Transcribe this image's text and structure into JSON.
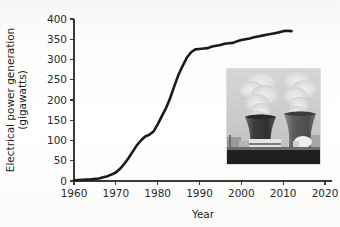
{
  "chart_data": {
    "type": "line",
    "title": "",
    "xlabel": "Year",
    "ylabel": "Electrical power generation (gigawatts)",
    "ylabel_line1": "Electrical power generation",
    "ylabel_line2": "(gigawatts)",
    "xlim": [
      1960,
      2020
    ],
    "ylim": [
      0,
      400
    ],
    "xticks": [
      1960,
      1970,
      1980,
      1990,
      2000,
      2010,
      2020
    ],
    "xtick_labels": [
      "1960",
      "1970",
      "1980",
      "1990",
      "2000",
      "2010",
      "2020"
    ],
    "yticks": [
      0,
      50,
      100,
      150,
      200,
      250,
      300,
      350,
      400
    ],
    "ytick_labels": [
      "0",
      "50",
      "100",
      "150",
      "200",
      "250",
      "300",
      "350",
      "400"
    ],
    "grid": false,
    "legend": false,
    "series": [
      {
        "name": "Nuclear electrical power generation",
        "color": "#1a1a1a",
        "x": [
          1960,
          1962,
          1964,
          1966,
          1967,
          1968,
          1969,
          1970,
          1971,
          1972,
          1973,
          1974,
          1975,
          1976,
          1977,
          1978,
          1979,
          1980,
          1981,
          1982,
          1983,
          1984,
          1985,
          1986,
          1987,
          1988,
          1989,
          1990,
          1991,
          1992,
          1993,
          1994,
          1995,
          1996,
          1997,
          1998,
          1999,
          2000,
          2001,
          2002,
          2003,
          2004,
          2005,
          2006,
          2007,
          2008,
          2009,
          2010,
          2011,
          2012
        ],
        "values": [
          2,
          3,
          4,
          6,
          9,
          12,
          16,
          21,
          30,
          42,
          56,
          72,
          88,
          100,
          110,
          114,
          122,
          140,
          160,
          180,
          205,
          235,
          263,
          285,
          305,
          318,
          325,
          326,
          327,
          328,
          332,
          334,
          336,
          339,
          340,
          341,
          345,
          348,
          350,
          352,
          355,
          357,
          359,
          361,
          363,
          365,
          367,
          370,
          371,
          370
        ]
      }
    ]
  },
  "inset": {
    "name": "nuclear-power-plant-photo",
    "alt": "Photograph of a nuclear power plant with two cooling towers emitting steam",
    "caption": ""
  }
}
